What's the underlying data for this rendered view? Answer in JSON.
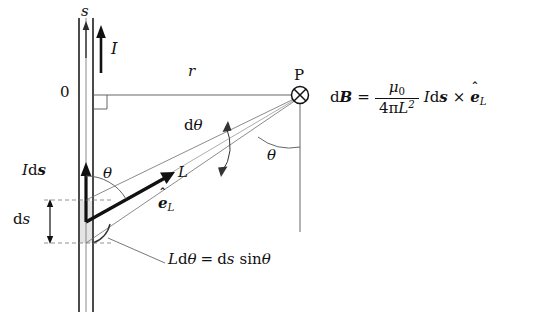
{
  "figure": {
    "background": "#ffffff",
    "line_color": "#3c3c3c",
    "bold_color": "#111111",
    "shade_color": "#e2e2e2",
    "width": 538,
    "height": 327
  },
  "labels": {
    "s_axis": "s",
    "current": "I",
    "origin": "0",
    "distance_r": "r",
    "point_P": "P",
    "d_theta": "dθ",
    "theta_wire": "θ",
    "theta_point": "θ",
    "I_ds": {
      "I": "I",
      "d": "d",
      "s": "s"
    },
    "length_L": "L",
    "unit_vector": {
      "hat": "ˆ",
      "e": "e",
      "sub": "L"
    },
    "ds_segment": {
      "d": "d",
      "s": "s"
    },
    "arc_relation": {
      "L": "L",
      "d": "d",
      "theta": "θ",
      "equals": "=",
      "ds_d": "d",
      "ds_s": "s",
      "sin": "sin",
      "sin_theta": "θ"
    }
  },
  "formula": {
    "dB_d": "d",
    "dB_B": "B",
    "equals": "=",
    "numerator_mu": "μ",
    "numerator_sub": "0",
    "denominator_4pi": "4π",
    "denominator_L": "L",
    "denominator_exp": "2",
    "current_I": "I",
    "ds_d": "d",
    "ds_s": "s",
    "cross": "×",
    "e_hat": "ˆ",
    "e_letter": "e",
    "e_sub": "L",
    "plain_text": "dB = μ0/(4πL²) I ds × êL"
  },
  "geometry": {
    "wire_x_left": 78,
    "wire_x_right": 94,
    "origin_y": 95,
    "point_P_x": 300,
    "point_P_y": 95,
    "ds_top_y": 200,
    "ds_bottom_y": 243
  }
}
